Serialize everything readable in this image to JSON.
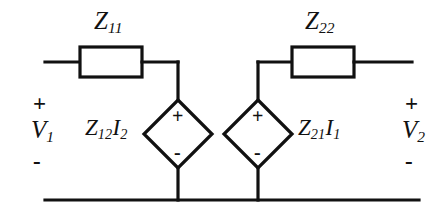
{
  "figure": {
    "background_color": "#ffffff",
    "line_color": "#111111"
  },
  "impedances": [
    {
      "name": "z11",
      "label_base": "Z",
      "label_sub": "11",
      "position": "top-left"
    },
    {
      "name": "z22",
      "label_base": "Z",
      "label_sub": "22",
      "position": "top-right"
    }
  ],
  "sources": [
    {
      "name": "dependent-source-left",
      "expr_base1": "Z",
      "expr_sub1": "12",
      "expr_base2": "I",
      "expr_sub2": "2",
      "plus": "+",
      "minus": "-"
    },
    {
      "name": "dependent-source-right",
      "expr_base1": "Z",
      "expr_sub1": "21",
      "expr_base2": "I",
      "expr_sub2": "1",
      "plus": "+",
      "minus": "-"
    }
  ],
  "ports": [
    {
      "name": "port-1",
      "plus": "+",
      "voltage_base": "V",
      "voltage_sub": "1",
      "minus": "-"
    },
    {
      "name": "port-2",
      "plus": "+",
      "voltage_base": "V",
      "voltage_sub": "2",
      "minus": "-"
    }
  ]
}
